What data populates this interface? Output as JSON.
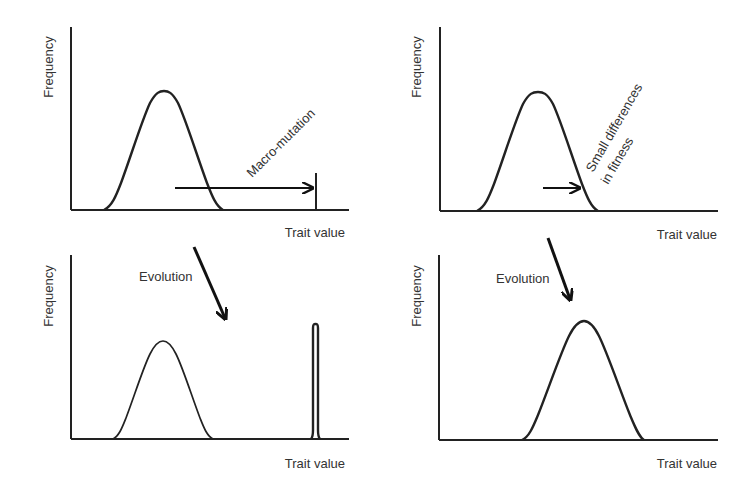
{
  "colors": {
    "line": "#222222",
    "text": "#333333",
    "background": "#ffffff"
  },
  "panels": [
    {
      "id": "top-left",
      "ylabel": "Frequency",
      "xlabel": "Trait value",
      "annotation": "Macro-mutation"
    },
    {
      "id": "top-right",
      "ylabel": "Frequency",
      "xlabel": "Trait value",
      "annotation_line1": "Small differences",
      "annotation_line2": "in fitness"
    },
    {
      "id": "bottom-left",
      "ylabel": "Frequency",
      "xlabel": "Trait value",
      "arrow_label": "Evolution"
    },
    {
      "id": "bottom-right",
      "ylabel": "Frequency",
      "xlabel": "Trait value",
      "arrow_label": "Evolution"
    }
  ]
}
